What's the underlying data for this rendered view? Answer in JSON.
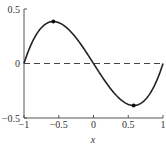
{
  "chart_data": {
    "type": "line",
    "title": "",
    "xlabel": "x",
    "ylabel": "",
    "xlim": [
      -1,
      1
    ],
    "ylim": [
      -0.5,
      0.5
    ],
    "grid": false,
    "legend": null,
    "x_ticks": [
      -1,
      -0.5,
      0,
      0.5,
      1
    ],
    "x_tick_labels": [
      "−1",
      "−0.5",
      "0",
      "0.5",
      "1"
    ],
    "y_ticks": [
      -0.5,
      0,
      0.5
    ],
    "y_tick_labels": [
      "−0.5",
      "0",
      "0.5"
    ],
    "series": [
      {
        "name": "f(x) = x³ − x",
        "style": "solid",
        "color": "#222222",
        "x": [
          -1,
          -0.9,
          -0.8,
          -0.7,
          -0.6,
          -0.577,
          -0.5,
          -0.4,
          -0.3,
          -0.2,
          -0.1,
          0,
          0.1,
          0.2,
          0.3,
          0.4,
          0.5,
          0.577,
          0.6,
          0.7,
          0.8,
          0.9,
          1
        ],
        "y": [
          0,
          0.171,
          0.288,
          0.357,
          0.384,
          0.385,
          0.375,
          0.336,
          0.273,
          0.192,
          0.099,
          0,
          -0.099,
          -0.192,
          -0.273,
          -0.336,
          -0.375,
          -0.385,
          -0.384,
          -0.357,
          -0.288,
          -0.171,
          0
        ]
      },
      {
        "name": "y = 0",
        "style": "dashed",
        "color": "#444444",
        "x": [
          -1,
          1
        ],
        "y": [
          0,
          0
        ]
      }
    ],
    "markers": [
      {
        "label": "local max",
        "x": -0.577,
        "y": 0.385
      },
      {
        "label": "local min",
        "x": 0.577,
        "y": -0.385
      }
    ]
  }
}
